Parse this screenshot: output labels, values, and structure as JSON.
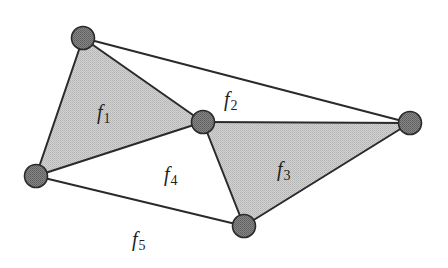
{
  "diagram": {
    "type": "planar-graph",
    "colors": {
      "shaded_face": "#c9c9c9",
      "node_fill": "#7a7a7a",
      "edge": "#2a2a2a",
      "background": "#ffffff"
    },
    "vertices": [
      {
        "id": "v1",
        "x": 83,
        "y": 38
      },
      {
        "id": "v2",
        "x": 203,
        "y": 122
      },
      {
        "id": "v3",
        "x": 410,
        "y": 123
      },
      {
        "id": "v4",
        "x": 36,
        "y": 176
      },
      {
        "id": "v5",
        "x": 244,
        "y": 226
      }
    ],
    "edges": [
      [
        "v1",
        "v2"
      ],
      [
        "v1",
        "v3"
      ],
      [
        "v1",
        "v4"
      ],
      [
        "v2",
        "v4"
      ],
      [
        "v2",
        "v3"
      ],
      [
        "v2",
        "v5"
      ],
      [
        "v3",
        "v5"
      ],
      [
        "v4",
        "v5"
      ]
    ],
    "faces": [
      {
        "id": "f1",
        "base": "f",
        "sub": "1",
        "shaded": true,
        "label_x": 97,
        "label_y": 119
      },
      {
        "id": "f2",
        "base": "f",
        "sub": "2",
        "shaded": false,
        "label_x": 224,
        "label_y": 106
      },
      {
        "id": "f3",
        "base": "f",
        "sub": "3",
        "shaded": true,
        "label_x": 277,
        "label_y": 176
      },
      {
        "id": "f4",
        "base": "f",
        "sub": "4",
        "shaded": false,
        "label_x": 164,
        "label_y": 181
      },
      {
        "id": "f5",
        "base": "f",
        "sub": "5",
        "shaded": false,
        "label_x": 132,
        "label_y": 246
      }
    ]
  }
}
